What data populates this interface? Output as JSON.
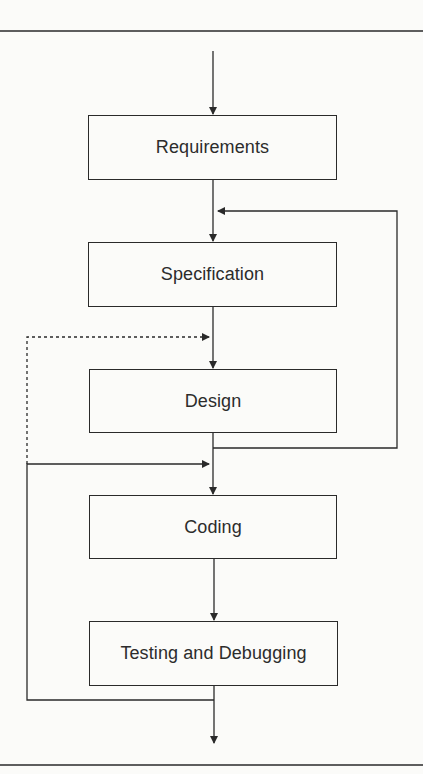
{
  "diagram": {
    "type": "flowchart",
    "title": "",
    "stages": [
      {
        "id": "requirements",
        "label": "Requirements"
      },
      {
        "id": "specification",
        "label": "Specification"
      },
      {
        "id": "design",
        "label": "Design"
      },
      {
        "id": "coding",
        "label": "Coding"
      },
      {
        "id": "testing",
        "label": "Testing and Debugging"
      }
    ],
    "edges": [
      {
        "from": "start",
        "to": "requirements",
        "style": "solid"
      },
      {
        "from": "requirements",
        "to": "specification",
        "style": "solid"
      },
      {
        "from": "specification",
        "to": "design",
        "style": "solid"
      },
      {
        "from": "design",
        "to": "coding",
        "style": "solid"
      },
      {
        "from": "coding",
        "to": "testing",
        "style": "solid"
      },
      {
        "from": "testing",
        "to": "end",
        "style": "solid"
      },
      {
        "from": "design",
        "to": "specification",
        "style": "solid",
        "kind": "feedback-right"
      },
      {
        "from": "testing",
        "to": "coding",
        "style": "solid",
        "kind": "feedback-left"
      },
      {
        "from": "testing",
        "to": "design",
        "style": "dashed",
        "kind": "feedback-left"
      }
    ],
    "colors": {
      "line": "#2a2a2a",
      "background": "#fbfbf9",
      "text": "#2c2c2c"
    }
  }
}
